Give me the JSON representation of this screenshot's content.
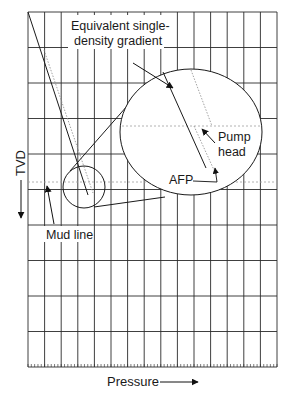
{
  "diagram": {
    "title": "",
    "axes": {
      "y_label": "TVD",
      "x_label": "Pressure",
      "y_direction": "down",
      "x_direction": "right"
    },
    "grid": {
      "left": 28,
      "top": 12,
      "right": 277,
      "bottom": 367,
      "columns": 15,
      "rows": 10,
      "minor_ticks_per_column": 5
    },
    "labels": {
      "equivalent_line1": "Equivalent single-",
      "equivalent_line2": "density gradient",
      "pump_head_line1": "Pump",
      "pump_head_line2": "head",
      "afp": "AFP",
      "mud_line": "Mud line",
      "tvd": "TVD",
      "pressure": "Pressure"
    },
    "elements": {
      "main_gradient_line": {
        "x1": 28,
        "y1": 12,
        "x2": 88,
        "y2": 195
      },
      "dotted_gradient_line": {
        "x1": 44,
        "y1": 50,
        "x2": 93,
        "y2": 193
      },
      "mud_line_y": 182,
      "small_circle": {
        "cx": 84,
        "cy": 187,
        "r": 21
      },
      "magnified_ellipse": {
        "cx": 191,
        "cy": 132,
        "rx": 71,
        "ry": 63
      },
      "ellipse_solid_line": {
        "x1": 163,
        "y1": 72,
        "x2": 206,
        "y2": 168
      },
      "ellipse_dotted_upper": {
        "x1": 191,
        "y1": 70,
        "x2": 212,
        "y2": 126
      },
      "ellipse_dotted_lower": {
        "x1": 194,
        "y1": 126,
        "x2": 214,
        "y2": 170
      },
      "ellipse_dotted_horizontal_y": 126
    },
    "colors": {
      "line": "#1a1a1a",
      "dotted": "#8a8a8a",
      "background": "#ffffff"
    }
  }
}
